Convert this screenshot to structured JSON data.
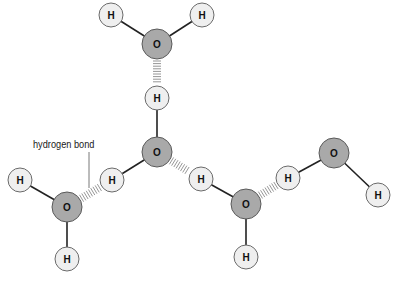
{
  "diagram": {
    "annotation": {
      "label": "hydrogen bond",
      "x": 33,
      "y": 139,
      "leader": {
        "x": 89,
        "y1": 152,
        "y2": 188
      }
    },
    "colors": {
      "oxygen_fill": "#a9a9a9",
      "oxygen_stroke": "#5a5a5a",
      "hydrogen_fill": "#efefef",
      "hydrogen_stroke": "#6a6a6a",
      "bond": "#222222",
      "hbond": "#8a8a8a",
      "text": "#111111"
    },
    "atoms": [
      {
        "id": "o1",
        "element": "O",
        "x": 157,
        "y": 44,
        "r": 15
      },
      {
        "id": "h1a",
        "element": "H",
        "x": 111,
        "y": 15,
        "r": 12
      },
      {
        "id": "h1b",
        "element": "H",
        "x": 202,
        "y": 15,
        "r": 12
      },
      {
        "id": "h2a",
        "element": "H",
        "x": 157,
        "y": 98,
        "r": 12
      },
      {
        "id": "o2",
        "element": "O",
        "x": 157,
        "y": 152,
        "r": 15
      },
      {
        "id": "h2b",
        "element": "H",
        "x": 112,
        "y": 180,
        "r": 12
      },
      {
        "id": "h3a",
        "element": "H",
        "x": 20,
        "y": 180,
        "r": 12
      },
      {
        "id": "o3",
        "element": "O",
        "x": 67,
        "y": 207,
        "r": 15
      },
      {
        "id": "h3b",
        "element": "H",
        "x": 67,
        "y": 259,
        "r": 12
      },
      {
        "id": "h4a",
        "element": "H",
        "x": 201,
        "y": 179,
        "r": 12
      },
      {
        "id": "o4",
        "element": "O",
        "x": 246,
        "y": 204,
        "r": 15
      },
      {
        "id": "h4b",
        "element": "H",
        "x": 246,
        "y": 257,
        "r": 12
      },
      {
        "id": "h5a",
        "element": "H",
        "x": 288,
        "y": 178,
        "r": 12
      },
      {
        "id": "o5",
        "element": "O",
        "x": 334,
        "y": 153,
        "r": 15
      },
      {
        "id": "h5b",
        "element": "H",
        "x": 378,
        "y": 195,
        "r": 12
      }
    ],
    "covalent_bonds": [
      [
        "o1",
        "h1a"
      ],
      [
        "o1",
        "h1b"
      ],
      [
        "o2",
        "h2a"
      ],
      [
        "o2",
        "h2b"
      ],
      [
        "o3",
        "h3a"
      ],
      [
        "o3",
        "h3b"
      ],
      [
        "o4",
        "h4a"
      ],
      [
        "o4",
        "h4b"
      ],
      [
        "o5",
        "h5a"
      ],
      [
        "o5",
        "h5b"
      ]
    ],
    "hydrogen_bonds": [
      [
        "o1",
        "h2a"
      ],
      [
        "o3",
        "h2b"
      ],
      [
        "o2",
        "h4a"
      ],
      [
        "o4",
        "h5a"
      ]
    ]
  }
}
